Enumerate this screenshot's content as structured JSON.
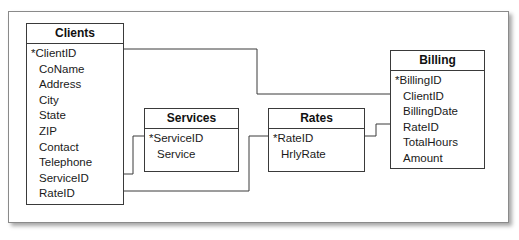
{
  "diagram": {
    "type": "entity-relationship",
    "entities": [
      {
        "name": "Clients",
        "fields": [
          "*ClientID",
          "CoName",
          "Address",
          "City",
          "State",
          "ZIP",
          "Contact",
          "Telephone",
          "ServiceID",
          "RateID"
        ]
      },
      {
        "name": "Services",
        "fields": [
          "*ServiceID",
          "Service"
        ]
      },
      {
        "name": "Rates",
        "fields": [
          "*RateID",
          "HrlyRate"
        ]
      },
      {
        "name": "Billing",
        "fields": [
          "*BillingID",
          "ClientID",
          "BillingDate",
          "RateID",
          "TotalHours",
          "Amount"
        ]
      }
    ],
    "relationships": [
      {
        "from": "Clients.ClientID",
        "to": "Billing.ClientID"
      },
      {
        "from": "Clients.ServiceID",
        "to": "Services.ServiceID"
      },
      {
        "from": "Clients.RateID",
        "to": "Rates.RateID"
      },
      {
        "from": "Rates.RateID",
        "to": "Billing.RateID"
      }
    ],
    "colors": {
      "line": "#3a3a3a",
      "frame": "#8a8a8a",
      "background": "#ffffff"
    }
  }
}
